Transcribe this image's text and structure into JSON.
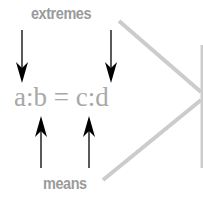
{
  "diagram": {
    "top_label": "extremes",
    "bottom_label": "means",
    "equation": "a:b = c:d",
    "colors": {
      "label": "#9a9a9a",
      "equation": "#a8a8a8",
      "arrows": "#000000",
      "connector_lines": "#cccccc"
    },
    "arrows": [
      {
        "from": "extremes",
        "to": "a",
        "direction": "down"
      },
      {
        "from": "extremes",
        "to": "d",
        "direction": "down"
      },
      {
        "from": "means",
        "to": "b",
        "direction": "up"
      },
      {
        "from": "means",
        "to": "c",
        "direction": "up"
      }
    ]
  }
}
